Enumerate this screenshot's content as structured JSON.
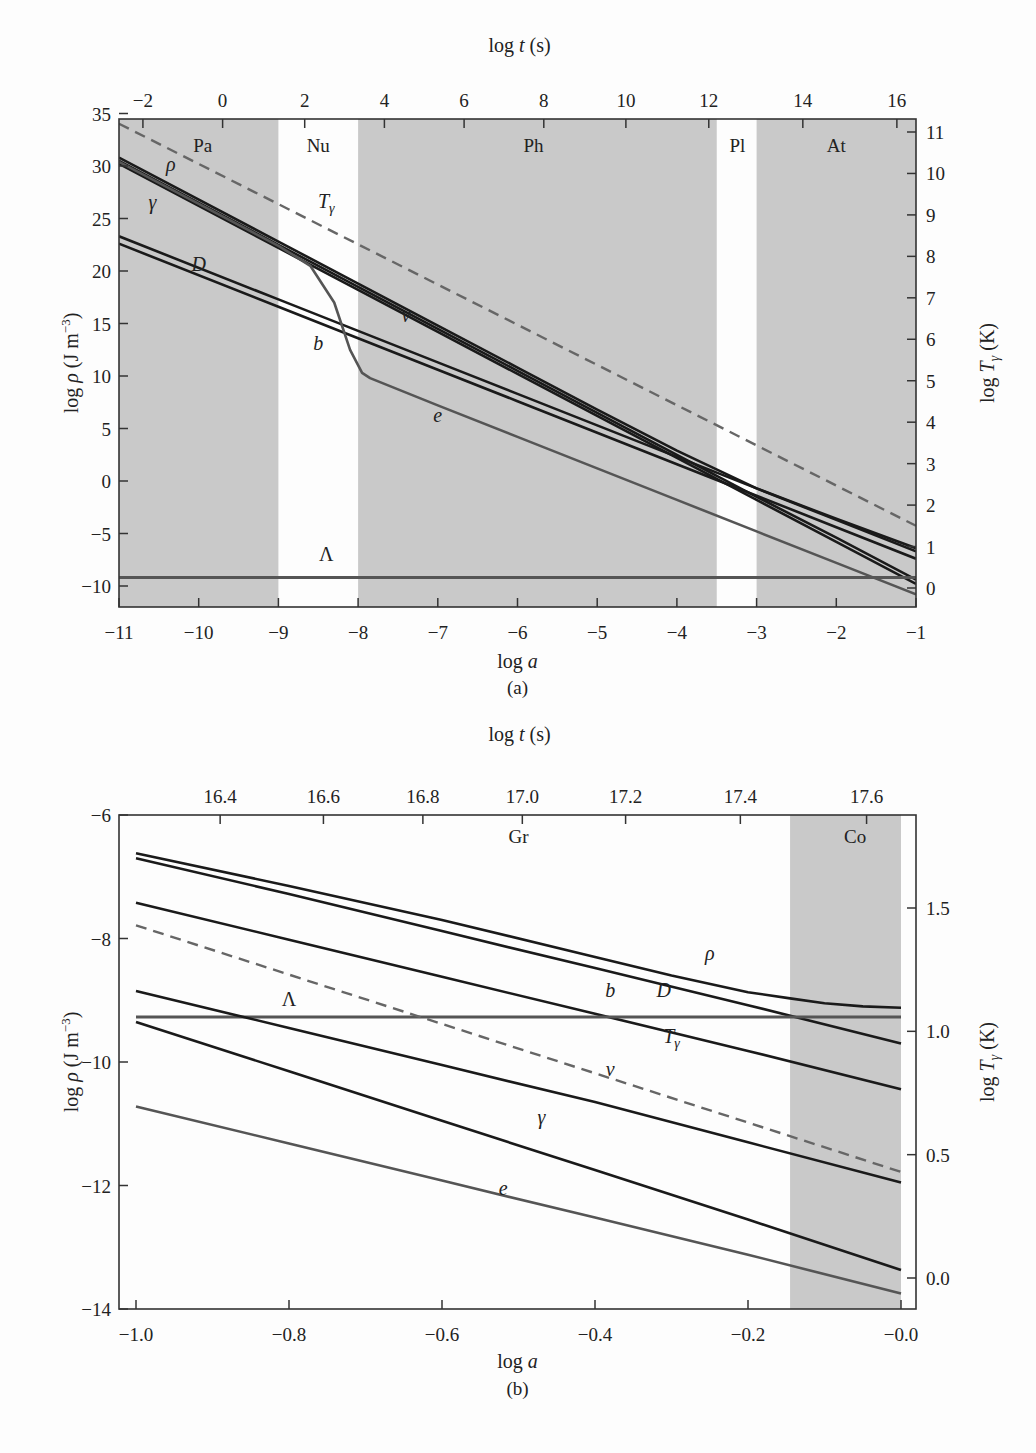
{
  "chart_data": [
    {
      "id": "a",
      "type": "line",
      "caption": "(a)",
      "title": "",
      "xlabel": "log a",
      "ylabel": "log ρ (J m^-3)",
      "top_xlabel": "log t (s)",
      "right_ylabel": "log T_γ (K)",
      "xlim": [
        -11,
        -1
      ],
      "ylim": [
        -12,
        35
      ],
      "right_ylim": [
        -0.5,
        11.2
      ],
      "x_ticks": [
        -11,
        -10,
        -9,
        -8,
        -7,
        -6,
        -5,
        -4,
        -3,
        -2,
        -1
      ],
      "x_tick_labels": [
        "−11",
        "−10",
        "−9",
        "−8",
        "−7",
        "−6",
        "−5",
        "−4",
        "−3",
        "−2",
        "−1"
      ],
      "y_ticks": [
        35,
        30,
        25,
        20,
        15,
        10,
        5,
        0,
        -5,
        -10
      ],
      "y_tick_labels": [
        "35",
        "30",
        "25",
        "20",
        "15",
        "10",
        "5",
        "0",
        "−5",
        "−10"
      ],
      "top_ticks_loga": [
        -10.7,
        -9.7,
        -8.67,
        -7.67,
        -6.67,
        -5.67,
        -4.64,
        -3.6,
        -2.42,
        -1.24
      ],
      "top_tick_labels": [
        "−2",
        "0",
        "2",
        "4",
        "6",
        "8",
        "10",
        "12",
        "14",
        "16"
      ],
      "right_ticks": [
        11,
        10,
        9,
        8,
        7,
        6,
        5,
        4,
        3,
        2,
        1,
        0
      ],
      "right_tick_labels": [
        "11",
        "10",
        "9",
        "8",
        "7",
        "6",
        "5",
        "4",
        "3",
        "2",
        "1",
        "0"
      ],
      "grid": false,
      "legend": "none (curves labelled inline)",
      "shaded_eras": [
        {
          "label": "Pa",
          "x_from": -11,
          "x_to": -9,
          "shaded": true
        },
        {
          "label": "Nu",
          "x_from": -9,
          "x_to": -8,
          "shaded": false
        },
        {
          "label": "Ph",
          "x_from": -8,
          "x_to": -3.5,
          "shaded": true
        },
        {
          "label": "Pl",
          "x_from": -3.5,
          "x_to": -3,
          "shaded": false
        },
        {
          "label": "At",
          "x_from": -3,
          "x_to": -1,
          "shaded": true
        }
      ],
      "series": [
        {
          "name": "ρ",
          "label": "ρ",
          "style": "solid",
          "color": "#1a1a1a",
          "x": [
            -11,
            -9,
            -8,
            -7,
            -6,
            -5,
            -4,
            -3,
            -2,
            -1
          ],
          "y": [
            30.8,
            22.8,
            18.8,
            14.8,
            10.8,
            6.8,
            2.9,
            -0.7,
            -3.6,
            -6.4
          ]
        },
        {
          "name": "γ",
          "label": "γ",
          "style": "solid",
          "color": "#1a1a1a",
          "x": [
            -11,
            -9,
            -8,
            -7,
            -6,
            -5,
            -4,
            -3,
            -2,
            -1
          ],
          "y": [
            30.2,
            22.2,
            18.2,
            14.2,
            10.2,
            6.2,
            2.2,
            -1.8,
            -5.8,
            -9.8
          ]
        },
        {
          "name": "ν",
          "label": "ν",
          "style": "solid",
          "color": "#1a1a1a",
          "x": [
            -11,
            -9,
            -8,
            -7,
            -6,
            -5,
            -4,
            -3,
            -2,
            -1
          ],
          "y": [
            30.5,
            22.5,
            18.5,
            14.5,
            10.5,
            6.5,
            2.5,
            -1.5,
            -5.4,
            -9.4
          ]
        },
        {
          "name": "D",
          "label": "D",
          "style": "solid",
          "color": "#1a1a1a",
          "x": [
            -11,
            -9,
            -8,
            -7,
            -6,
            -5,
            -4,
            -3,
            -2,
            -1
          ],
          "y": [
            23.3,
            17.3,
            14.3,
            11.3,
            8.3,
            5.3,
            2.3,
            -0.7,
            -3.7,
            -6.7
          ]
        },
        {
          "name": "b",
          "label": "b",
          "style": "solid",
          "color": "#1a1a1a",
          "x": [
            -11,
            -9,
            -8,
            -7,
            -6,
            -5,
            -4,
            -3,
            -2,
            -1
          ],
          "y": [
            22.6,
            16.6,
            13.6,
            10.6,
            7.6,
            4.6,
            1.6,
            -1.4,
            -4.4,
            -7.4
          ]
        },
        {
          "name": "e",
          "label": "e",
          "style": "solid",
          "color": "#555555",
          "x": [
            -11,
            -9,
            -8.6,
            -8.3,
            -8.1,
            -7.95,
            -7.85,
            -7,
            -6,
            -5,
            -4,
            -3,
            -2,
            -1
          ],
          "y": [
            30.4,
            22.4,
            20.5,
            17.0,
            12.5,
            10.3,
            9.8,
            7.2,
            4.2,
            1.2,
            -1.8,
            -4.8,
            -7.8,
            -10.8
          ]
        },
        {
          "name": "Λ",
          "label": "Λ",
          "style": "solid",
          "color": "#555555",
          "x": [
            -11,
            -1
          ],
          "y": [
            -9.2,
            -9.2
          ]
        },
        {
          "name": "T_γ",
          "label": "Tγ",
          "style": "dashed",
          "color": "#666666",
          "axis": "right",
          "x": [
            -11,
            -1
          ],
          "y_right": [
            11.2,
            1.5
          ]
        }
      ],
      "annotations": [
        {
          "text": "Pa",
          "x": -9.95,
          "y": 31.3
        },
        {
          "text": "Nu",
          "x": -8.5,
          "y": 31.3
        },
        {
          "text": "Ph",
          "x": -5.8,
          "y": 31.3
        },
        {
          "text": "Pl",
          "x": -3.24,
          "y": 31.3
        },
        {
          "text": "At",
          "x": -2.0,
          "y": 31.3
        },
        {
          "text": "ρ",
          "x": -10.35,
          "y": 29.5
        },
        {
          "text": "γ",
          "x": -10.58,
          "y": 25.9
        },
        {
          "text": "Tγ",
          "x": -8.4,
          "y": 26.0
        },
        {
          "text": "D",
          "x": -10.0,
          "y": 20.0
        },
        {
          "text": "b",
          "x": -8.5,
          "y": 12.5
        },
        {
          "text": "ν",
          "x": -7.4,
          "y": 15.1
        },
        {
          "text": "e",
          "x": -7.0,
          "y": 5.6
        },
        {
          "text": "Λ",
          "x": -8.4,
          "y": -7.6
        }
      ]
    },
    {
      "id": "b",
      "type": "line",
      "caption": "(b)",
      "title": "",
      "xlabel": "log a",
      "ylabel": "log ρ (J m^-3)",
      "top_xlabel": "log t (s)",
      "right_ylabel": "log T_γ (K)",
      "xlim": [
        -1.02,
        0.02
      ],
      "ylim": [
        -14,
        -6
      ],
      "right_ylim": [
        -0.12,
        1.9
      ],
      "x_ticks": [
        -1.0,
        -0.8,
        -0.6,
        -0.4,
        -0.2,
        0.0
      ],
      "x_tick_labels": [
        "−1.0",
        "−0.8",
        "−0.6",
        "−0.4",
        "−0.2",
        "−0.0"
      ],
      "y_ticks": [
        -6,
        -8,
        -10,
        -12,
        -14
      ],
      "y_tick_labels": [
        "−6",
        "−8",
        "−10",
        "−12",
        "−14"
      ],
      "top_ticks_loga": [
        -0.89,
        -0.755,
        -0.625,
        -0.495,
        -0.36,
        -0.21,
        -0.045
      ],
      "top_tick_labels": [
        "16.4",
        "16.6",
        "16.8",
        "17.0",
        "17.2",
        "17.4",
        "17.6"
      ],
      "right_ticks": [
        1.5,
        1.0,
        0.5,
        0.0
      ],
      "right_tick_labels": [
        "1.5",
        "1.0",
        "0.5",
        "0.0"
      ],
      "grid": false,
      "legend": "none (curves labelled inline)",
      "shaded_eras": [
        {
          "label": "Gr",
          "x_from": -1.02,
          "x_to": -0.145,
          "shaded": false
        },
        {
          "label": "Co",
          "x_from": -0.145,
          "x_to": 0.0,
          "shaded": true
        }
      ],
      "series": [
        {
          "name": "ρ",
          "label": "ρ",
          "style": "solid",
          "color": "#1a1a1a",
          "x": [
            -1.0,
            -0.8,
            -0.6,
            -0.4,
            -0.3,
            -0.2,
            -0.145,
            -0.1,
            -0.05,
            0.0
          ],
          "y": [
            -6.62,
            -7.15,
            -7.7,
            -8.3,
            -8.6,
            -8.87,
            -8.97,
            -9.05,
            -9.1,
            -9.12
          ]
        },
        {
          "name": "D",
          "label": "D",
          "style": "solid",
          "color": "#1a1a1a",
          "x": [
            -1.0,
            -0.8,
            -0.6,
            -0.4,
            -0.2,
            0.0
          ],
          "y": [
            -6.7,
            -7.28,
            -7.88,
            -8.48,
            -9.08,
            -9.7
          ]
        },
        {
          "name": "b",
          "label": "b",
          "style": "solid",
          "color": "#1a1a1a",
          "x": [
            -1.0,
            -0.8,
            -0.6,
            -0.4,
            -0.2,
            0.0
          ],
          "y": [
            -7.42,
            -8.02,
            -8.62,
            -9.22,
            -9.82,
            -10.44
          ]
        },
        {
          "name": "Λ",
          "label": "Λ",
          "style": "solid",
          "color": "#555555",
          "x": [
            -1.0,
            0.0
          ],
          "y": [
            -9.27,
            -9.27
          ]
        },
        {
          "name": "ν",
          "label": "ν",
          "style": "solid",
          "color": "#1a1a1a",
          "x": [
            -1.0,
            -0.8,
            -0.6,
            -0.4,
            -0.2,
            0.0
          ],
          "y": [
            -8.85,
            -9.45,
            -10.05,
            -10.65,
            -11.3,
            -11.95
          ]
        },
        {
          "name": "γ",
          "label": "γ",
          "style": "solid",
          "color": "#1a1a1a",
          "x": [
            -1.0,
            -0.8,
            -0.6,
            -0.4,
            -0.2,
            0.0
          ],
          "y": [
            -9.35,
            -10.15,
            -10.95,
            -11.75,
            -12.55,
            -13.37
          ]
        },
        {
          "name": "e",
          "label": "e",
          "style": "solid",
          "color": "#555555",
          "x": [
            -1.0,
            -0.8,
            -0.6,
            -0.4,
            -0.2,
            0.0
          ],
          "y": [
            -10.72,
            -11.32,
            -11.92,
            -12.52,
            -13.12,
            -13.75
          ]
        },
        {
          "name": "T_γ",
          "label": "Tγ",
          "style": "dashed",
          "color": "#666666",
          "axis": "right",
          "x": [
            -1.0,
            0.0
          ],
          "y_right": [
            1.43,
            0.43
          ]
        }
      ],
      "annotations": [
        {
          "text": "Gr",
          "x": -0.5,
          "y": -6.45
        },
        {
          "text": "Co",
          "x": -0.06,
          "y": -6.45
        },
        {
          "text": "ρ",
          "x": -0.25,
          "y": -8.35
        },
        {
          "text": "b",
          "x": -0.38,
          "y": -8.95
        },
        {
          "text": "D",
          "x": -0.31,
          "y": -8.95
        },
        {
          "text": "Λ",
          "x": -0.8,
          "y": -9.1
        },
        {
          "text": "Tγ",
          "x": -0.3,
          "y": -9.7
        },
        {
          "text": "ν",
          "x": -0.38,
          "y": -10.22
        },
        {
          "text": "γ",
          "x": -0.47,
          "y": -11.0
        },
        {
          "text": "e",
          "x": -0.52,
          "y": -12.15
        }
      ]
    }
  ]
}
